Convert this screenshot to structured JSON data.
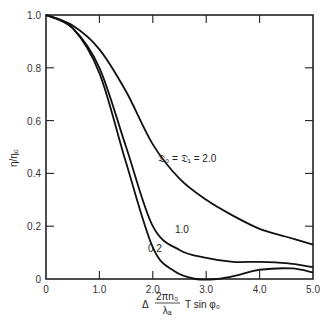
{
  "chart_data": {
    "type": "line",
    "title": "",
    "xlabel": "Δ (2πn₀/λₐ) T sin φ₀",
    "ylabel": "η/η₀",
    "xlim": [
      0,
      5.0
    ],
    "ylim": [
      0,
      1.0
    ],
    "grid": false,
    "legend": "inline annotations on curves",
    "x_ticks": [
      "0",
      "1.0",
      "2.0",
      "3.0",
      "4.0",
      "5.0"
    ],
    "y_ticks": [
      "0",
      "0.2",
      "0.4",
      "0.6",
      "0.8",
      "1.0"
    ],
    "series": [
      {
        "name": "𝔇₀ = 𝔇₁ = 2.0",
        "label": "𝔇₀ = 𝔇₁ = 2.0",
        "x": [
          0,
          0.5,
          1.0,
          1.5,
          2.0,
          2.5,
          3.0,
          3.5,
          4.0,
          4.5,
          5.0
        ],
        "y": [
          1.0,
          0.96,
          0.87,
          0.71,
          0.51,
          0.38,
          0.3,
          0.24,
          0.19,
          0.16,
          0.13
        ]
      },
      {
        "name": "1.0",
        "label": "1.0",
        "x": [
          0,
          0.5,
          1.0,
          1.5,
          2.0,
          2.5,
          3.0,
          3.5,
          4.0,
          4.5,
          5.0
        ],
        "y": [
          1.0,
          0.95,
          0.8,
          0.5,
          0.2,
          0.11,
          0.08,
          0.065,
          0.065,
          0.06,
          0.045
        ]
      },
      {
        "name": "0.2",
        "label": "0.2",
        "x": [
          0,
          0.5,
          1.0,
          1.5,
          2.0,
          2.4,
          2.8,
          3.2,
          3.6,
          4.0,
          4.6,
          5.0
        ],
        "y": [
          1.0,
          0.95,
          0.78,
          0.44,
          0.12,
          0.03,
          0.0,
          0.0,
          0.015,
          0.035,
          0.04,
          0.025
        ]
      }
    ]
  },
  "axes": {
    "ylabel": "η/η₀",
    "xlabel_delta": "Δ",
    "xlabel_num": "2πn₀",
    "xlabel_den": "λₐ",
    "xlabel_rest": "T  sin  φ₀"
  }
}
